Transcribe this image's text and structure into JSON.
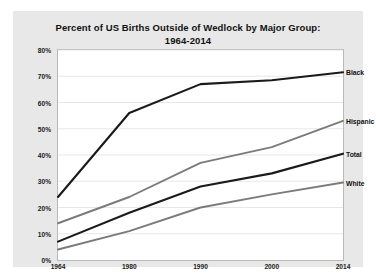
{
  "chart_data": {
    "type": "line",
    "title": "Percent of  US Births Outside of Wedlock by Major Group:",
    "subtitle": "1964-2014",
    "xlabel": "",
    "ylabel": "",
    "x": [
      "1964",
      "1980",
      "1990",
      "2000",
      "2014"
    ],
    "ylim": [
      0,
      80
    ],
    "yticks": [
      "0%",
      "10%",
      "20%",
      "30%",
      "40%",
      "50%",
      "60%",
      "70%",
      "80%"
    ],
    "ytick_values": [
      0,
      10,
      20,
      30,
      40,
      50,
      60,
      70,
      80
    ],
    "grid": true,
    "legend_position": "right-inline",
    "series": [
      {
        "name": "Black",
        "values": [
          24,
          56,
          67,
          68.5,
          71.5
        ],
        "color": "#1a1a1a",
        "width": 2.1
      },
      {
        "name": "Hispanic",
        "values": [
          14,
          24,
          37,
          43,
          53
        ],
        "color": "#7b7b7b",
        "width": 1.9
      },
      {
        "name": "Total",
        "values": [
          7,
          18,
          28,
          33,
          40.5
        ],
        "color": "#1a1a1a",
        "width": 2.1
      },
      {
        "name": "White",
        "values": [
          4,
          11,
          20,
          25,
          29.5
        ],
        "color": "#7b7b7b",
        "width": 1.9
      }
    ]
  },
  "colors": {
    "card_background": "#e8e8e8",
    "plot_background": "#ffffff",
    "plot_border": "#b9b9b9",
    "gridline": "#dcdcdc",
    "axis_text": "#1a1a1a"
  }
}
